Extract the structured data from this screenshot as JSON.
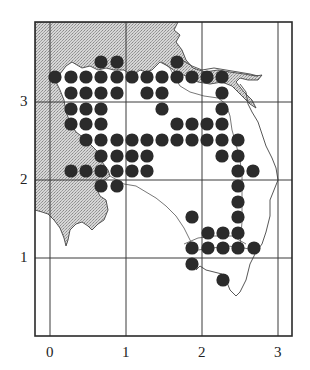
{
  "figure": {
    "type": "grid distribution map",
    "x_axis": {
      "ticks": [
        "0",
        "1",
        "2",
        "3"
      ]
    },
    "y_axis": {
      "ticks": [
        "1",
        "2",
        "3"
      ]
    },
    "colors": {
      "frame": "#2a2a2a",
      "grid": "#3a3a3a",
      "coast": "#444444",
      "land_shaded": "#c9c9c9",
      "dot": "#2b2b2b",
      "background": "#ffffff"
    }
  },
  "map_data": {
    "grid_units": "map grid squares, origin bottom-left",
    "dot_spacing_units": 0.2,
    "occupied_points_px": [
      [
        101,
        62
      ],
      [
        117,
        62
      ],
      [
        177,
        62
      ],
      [
        55,
        77
      ],
      [
        71,
        77
      ],
      [
        86,
        77
      ],
      [
        101,
        77
      ],
      [
        117,
        77
      ],
      [
        132,
        77
      ],
      [
        147,
        77
      ],
      [
        162,
        77
      ],
      [
        177,
        77
      ],
      [
        192,
        77
      ],
      [
        207,
        77
      ],
      [
        222,
        77
      ],
      [
        71,
        93
      ],
      [
        86,
        93
      ],
      [
        101,
        93
      ],
      [
        117,
        93
      ],
      [
        147,
        93
      ],
      [
        162,
        93
      ],
      [
        222,
        93
      ],
      [
        71,
        109
      ],
      [
        86,
        109
      ],
      [
        101,
        109
      ],
      [
        162,
        109
      ],
      [
        222,
        109
      ],
      [
        71,
        124
      ],
      [
        86,
        124
      ],
      [
        101,
        124
      ],
      [
        177,
        124
      ],
      [
        192,
        124
      ],
      [
        207,
        124
      ],
      [
        222,
        124
      ],
      [
        86,
        140
      ],
      [
        101,
        140
      ],
      [
        117,
        140
      ],
      [
        132,
        140
      ],
      [
        147,
        140
      ],
      [
        162,
        140
      ],
      [
        177,
        140
      ],
      [
        192,
        140
      ],
      [
        207,
        140
      ],
      [
        222,
        140
      ],
      [
        238,
        140
      ],
      [
        101,
        156
      ],
      [
        117,
        156
      ],
      [
        132,
        156
      ],
      [
        147,
        156
      ],
      [
        222,
        156
      ],
      [
        238,
        156
      ],
      [
        71,
        171
      ],
      [
        86,
        171
      ],
      [
        101,
        171
      ],
      [
        117,
        171
      ],
      [
        132,
        171
      ],
      [
        147,
        171
      ],
      [
        238,
        171
      ],
      [
        253,
        171
      ],
      [
        101,
        186
      ],
      [
        117,
        186
      ],
      [
        238,
        186
      ],
      [
        238,
        202
      ],
      [
        192,
        217
      ],
      [
        238,
        217
      ],
      [
        208,
        233
      ],
      [
        223,
        233
      ],
      [
        238,
        233
      ],
      [
        192,
        248
      ],
      [
        208,
        248
      ],
      [
        223,
        248
      ],
      [
        238,
        248
      ],
      [
        254,
        248
      ],
      [
        192,
        264
      ],
      [
        223,
        280
      ]
    ]
  }
}
